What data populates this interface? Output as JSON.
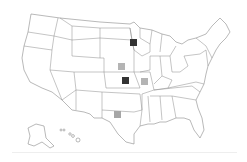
{
  "map": {
    "type": "US states choropleth / marker map",
    "colors": {
      "dark": "#333333",
      "light": "#b4b4b4",
      "medium": "#a6a6a6",
      "border": "#8a8a8a"
    },
    "markers": [
      {
        "id": "minnesota",
        "shade": "dark",
        "x": 130,
        "y": 39
      },
      {
        "id": "nebraska",
        "shade": "light",
        "x": 118,
        "y": 63
      },
      {
        "id": "kansas",
        "shade": "dark",
        "x": 122,
        "y": 77
      },
      {
        "id": "missouri",
        "shade": "light",
        "x": 141,
        "y": 78
      },
      {
        "id": "texas",
        "shade": "medium",
        "x": 114,
        "y": 111
      }
    ]
  }
}
